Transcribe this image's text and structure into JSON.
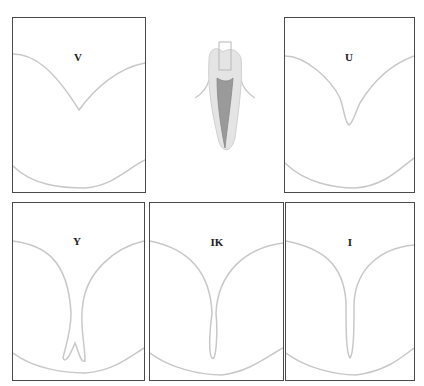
{
  "figure": {
    "center_illustration": "tooth-cross-section",
    "stroke_color": "#c8c8c8",
    "border_color": "#4a4a4a",
    "panels": [
      {
        "id": "v",
        "label": "V"
      },
      {
        "id": "u",
        "label": "U"
      },
      {
        "id": "y",
        "label": "Y"
      },
      {
        "id": "ik",
        "label": "IK"
      },
      {
        "id": "i",
        "label": "I"
      }
    ]
  }
}
